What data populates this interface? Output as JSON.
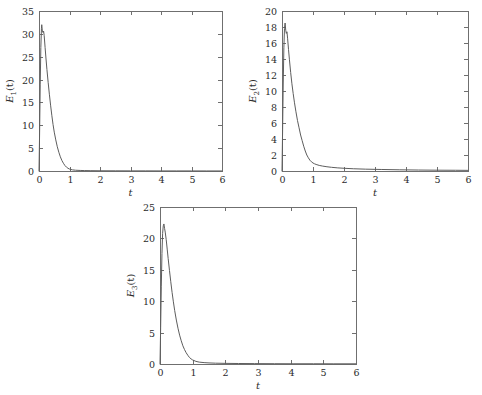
{
  "figure": {
    "background_color": "#ffffff",
    "line_color": "#5d5d5d",
    "axis_color": "#6f6f6f",
    "panel_count": 3
  },
  "chart_data": [
    {
      "type": "line",
      "id": "panel-1",
      "title": "",
      "xlabel": "t",
      "ylabel": "E_1(t)",
      "ylabel_base": "E",
      "ylabel_sub": "1",
      "ylabel_tail": "(t)",
      "xlim": [
        0,
        6
      ],
      "ylim": [
        0,
        35
      ],
      "grid": false,
      "legend": false,
      "xticks": [
        0,
        1,
        2,
        3,
        4,
        5,
        6
      ],
      "xticklabels": [
        "0",
        "1",
        "2",
        "3",
        "4",
        "5",
        "6"
      ],
      "yticks": [
        0,
        5,
        10,
        15,
        20,
        25,
        30,
        35
      ],
      "yticklabels": [
        "0",
        "5",
        "10",
        "15",
        "20",
        "25",
        "30",
        "35"
      ],
      "peak_value": 32.0,
      "peak_time": 0.09,
      "x": [
        0.0,
        0.02,
        0.04,
        0.06,
        0.08,
        0.09,
        0.11,
        0.13,
        0.15,
        0.17,
        0.2,
        0.23,
        0.26,
        0.3,
        0.34,
        0.38,
        0.42,
        0.46,
        0.5,
        0.55,
        0.6,
        0.65,
        0.7,
        0.75,
        0.8,
        0.85,
        0.9,
        0.95,
        1.0,
        1.1,
        1.2,
        1.35,
        1.5,
        1.7,
        2.0,
        2.5,
        3.0,
        3.5,
        4.0,
        4.5,
        5.0,
        5.5,
        6.0
      ],
      "y": [
        0.0,
        8.5,
        19.0,
        27.0,
        31.2,
        32.0,
        30.6,
        30.3,
        30.6,
        29.6,
        27.0,
        24.5,
        22.2,
        19.4,
        16.8,
        14.4,
        12.2,
        10.2,
        8.5,
        6.8,
        5.3,
        4.1,
        3.1,
        2.3,
        1.7,
        1.2,
        0.85,
        0.6,
        0.42,
        0.25,
        0.17,
        0.12,
        0.09,
        0.07,
        0.05,
        0.04,
        0.03,
        0.03,
        0.02,
        0.02,
        0.02,
        0.01,
        0.01
      ]
    },
    {
      "type": "line",
      "id": "panel-2",
      "title": "",
      "xlabel": "t",
      "ylabel": "E_2(t)",
      "ylabel_base": "E",
      "ylabel_sub": "2",
      "ylabel_tail": "(t)",
      "xlim": [
        0,
        6
      ],
      "ylim": [
        0,
        20
      ],
      "grid": false,
      "legend": false,
      "xticks": [
        0,
        1,
        2,
        3,
        4,
        5,
        6
      ],
      "xticklabels": [
        "0",
        "1",
        "2",
        "3",
        "4",
        "5",
        "6"
      ],
      "yticks": [
        0,
        2,
        4,
        6,
        8,
        10,
        12,
        14,
        16,
        18,
        20
      ],
      "yticklabels": [
        "0",
        "2",
        "4",
        "6",
        "8",
        "10",
        "12",
        "14",
        "16",
        "18",
        "20"
      ],
      "peak_value": 18.5,
      "peak_time": 0.1,
      "x": [
        0.0,
        0.02,
        0.04,
        0.06,
        0.08,
        0.1,
        0.12,
        0.14,
        0.16,
        0.18,
        0.21,
        0.24,
        0.28,
        0.32,
        0.36,
        0.4,
        0.45,
        0.5,
        0.55,
        0.6,
        0.65,
        0.7,
        0.75,
        0.8,
        0.85,
        0.9,
        0.95,
        1.0,
        1.05,
        1.1,
        1.2,
        1.3,
        1.45,
        1.6,
        1.8,
        2.0,
        2.3,
        2.7,
        3.2,
        3.8,
        4.4,
        5.0,
        5.6,
        6.0
      ],
      "y": [
        0.0,
        5.2,
        11.0,
        15.4,
        17.8,
        18.5,
        17.6,
        17.2,
        17.4,
        16.6,
        15.2,
        13.9,
        12.3,
        10.9,
        9.7,
        8.6,
        7.4,
        6.3,
        5.4,
        4.5,
        3.8,
        3.1,
        2.5,
        2.0,
        1.65,
        1.35,
        1.15,
        1.0,
        0.9,
        0.82,
        0.7,
        0.62,
        0.53,
        0.46,
        0.39,
        0.34,
        0.28,
        0.23,
        0.19,
        0.15,
        0.12,
        0.1,
        0.09,
        0.08
      ]
    },
    {
      "type": "line",
      "id": "panel-3",
      "title": "",
      "xlabel": "t",
      "ylabel": "E_3(t)",
      "ylabel_base": "E",
      "ylabel_sub": "3",
      "ylabel_tail": "(t)",
      "xlim": [
        0,
        6
      ],
      "ylim": [
        0,
        25
      ],
      "grid": false,
      "legend": false,
      "xticks": [
        0,
        1,
        2,
        3,
        4,
        5,
        6
      ],
      "xticklabels": [
        "0",
        "1",
        "2",
        "3",
        "4",
        "5",
        "6"
      ],
      "yticks": [
        0,
        5,
        10,
        15,
        20,
        25
      ],
      "yticklabels": [
        "0",
        "5",
        "10",
        "15",
        "20",
        "25"
      ],
      "peak_value": 22.3,
      "peak_time": 0.12,
      "x": [
        0.0,
        0.02,
        0.04,
        0.06,
        0.08,
        0.1,
        0.12,
        0.14,
        0.16,
        0.19,
        0.22,
        0.25,
        0.29,
        0.33,
        0.37,
        0.41,
        0.45,
        0.5,
        0.55,
        0.6,
        0.65,
        0.7,
        0.75,
        0.8,
        0.85,
        0.9,
        0.95,
        1.0,
        1.1,
        1.2,
        1.35,
        1.5,
        1.7,
        2.0,
        2.4,
        2.9,
        3.5,
        4.1,
        4.7,
        5.3,
        6.0
      ],
      "y": [
        0.0,
        5.8,
        12.4,
        17.6,
        20.8,
        22.0,
        22.3,
        21.6,
        21.0,
        19.8,
        18.3,
        16.8,
        14.9,
        13.1,
        11.4,
        9.9,
        8.5,
        7.0,
        5.7,
        4.6,
        3.7,
        2.9,
        2.3,
        1.8,
        1.4,
        1.05,
        0.82,
        0.64,
        0.42,
        0.3,
        0.22,
        0.17,
        0.13,
        0.1,
        0.08,
        0.06,
        0.05,
        0.04,
        0.04,
        0.03,
        0.03
      ]
    }
  ]
}
